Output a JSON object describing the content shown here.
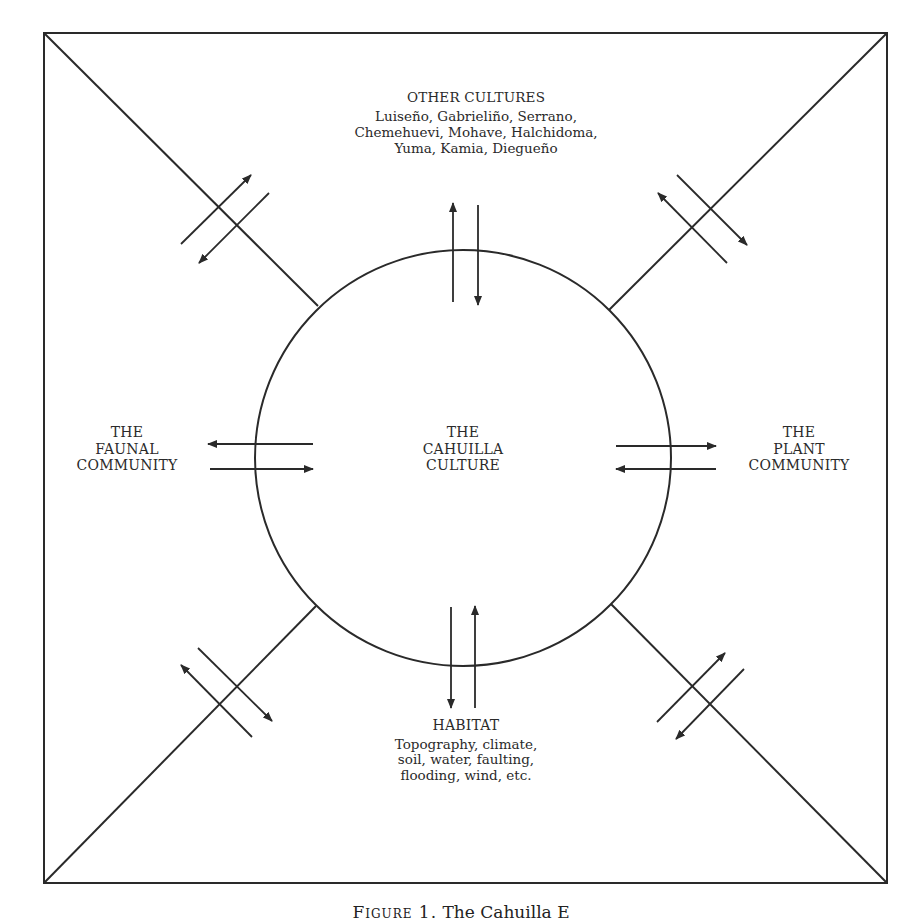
{
  "diagram": {
    "center": {
      "lines": [
        "THE",
        "CAHUILLA",
        "CULTURE"
      ]
    },
    "top": {
      "heading": "OTHER CULTURES",
      "lines": [
        "Luiseño, Gabrieliño, Serrano,",
        "Chemehuevi, Mohave, Halchidoma,",
        "Yuma, Kamia, Diegueño"
      ]
    },
    "left": {
      "lines": [
        "THE",
        "FAUNAL",
        "COMMUNITY"
      ]
    },
    "right": {
      "lines": [
        "THE",
        "PLANT",
        "COMMUNITY"
      ]
    },
    "bottom": {
      "heading": "HABITAT",
      "lines": [
        "Topography, climate,",
        "soil, water, faulting,",
        "flooding, wind, etc."
      ]
    },
    "colors": {
      "ink": "#2a2a2a",
      "background": "#ffffff"
    }
  },
  "caption": {
    "figure_label": "Figure 1.",
    "text": "The Cahuilla E"
  }
}
